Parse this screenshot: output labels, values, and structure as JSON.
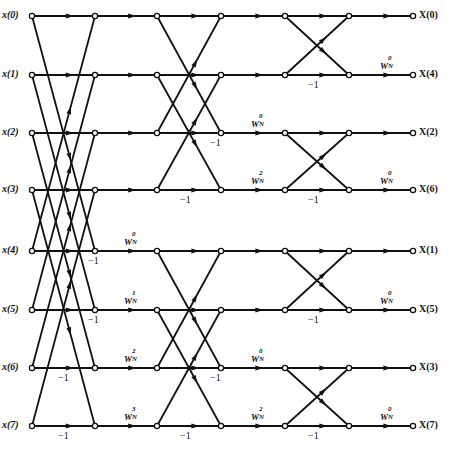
{
  "diagram": {
    "inputs": [
      "x(0)",
      "x(1)",
      "x(2)",
      "x(3)",
      "x(4)",
      "x(5)",
      "x(6)",
      "x(7)"
    ],
    "outputs": [
      "X(0)",
      "X(4)",
      "X(2)",
      "X(6)",
      "X(1)",
      "X(5)",
      "X(3)",
      "X(7)"
    ],
    "minus_one": "−1",
    "stage1_twiddles": [
      {
        "row": 4,
        "base": "W",
        "sup": "0",
        "sub": "N"
      },
      {
        "row": 5,
        "base": "W",
        "sup": "1",
        "sub": "N"
      },
      {
        "row": 6,
        "base": "W",
        "sup": "2",
        "sub": "N"
      },
      {
        "row": 7,
        "base": "W",
        "sup": "3",
        "sub": "N"
      }
    ],
    "stage2_twiddles": [
      {
        "row": 2,
        "base": "W",
        "sup": "0",
        "sub": "N"
      },
      {
        "row": 3,
        "base": "W",
        "sup": "2",
        "sub": "N"
      },
      {
        "row": 6,
        "base": "W",
        "sup": "0",
        "sub": "N"
      },
      {
        "row": 7,
        "base": "W",
        "sup": "2",
        "sub": "N"
      }
    ],
    "stage3_twiddles": [
      {
        "row": 1,
        "base": "W",
        "sup": "0",
        "sub": "N"
      },
      {
        "row": 3,
        "base": "W",
        "sup": "0",
        "sub": "N"
      },
      {
        "row": 5,
        "base": "W",
        "sup": "0",
        "sub": "N"
      },
      {
        "row": 7,
        "base": "W",
        "sup": "0",
        "sub": "N"
      }
    ]
  }
}
